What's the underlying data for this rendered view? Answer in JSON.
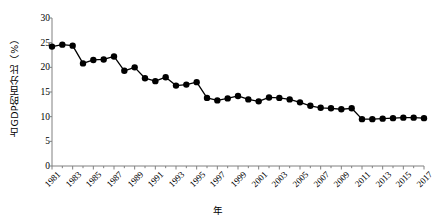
{
  "chart_data": {
    "type": "line",
    "title": "",
    "xlabel": "年",
    "ylabel": "占GDP的百分比（%）",
    "x": [
      1981,
      1982,
      1983,
      1984,
      1985,
      1986,
      1987,
      1988,
      1989,
      1990,
      1991,
      1992,
      1993,
      1994,
      1995,
      1996,
      1997,
      1998,
      1999,
      2000,
      2001,
      2002,
      2003,
      2004,
      2005,
      2006,
      2007,
      2008,
      2009,
      2010,
      2011,
      2012,
      2013,
      2014,
      2015,
      2016,
      2017
    ],
    "values": [
      24.2,
      24.6,
      24.4,
      20.8,
      21.5,
      21.6,
      22.2,
      19.3,
      20.0,
      17.8,
      17.2,
      18.0,
      16.3,
      16.5,
      17.0,
      13.8,
      13.3,
      13.7,
      14.2,
      13.5,
      13.1,
      13.9,
      13.8,
      13.5,
      12.9,
      12.2,
      11.8,
      11.7,
      11.5,
      11.7,
      9.5,
      9.5,
      9.6,
      9.7,
      9.8,
      9.8,
      9.7
    ],
    "xlim": [
      1981,
      2017
    ],
    "ylim": [
      0,
      30
    ],
    "yticks": [
      0,
      5,
      10,
      15,
      20,
      25,
      30
    ],
    "ytick_labels": [
      "0",
      "5",
      "10",
      "15",
      "20",
      "25",
      "30"
    ],
    "xticks": [
      1981,
      1983,
      1985,
      1987,
      1989,
      1991,
      1993,
      1995,
      1997,
      1999,
      2001,
      2003,
      2005,
      2007,
      2009,
      2011,
      2013,
      2015,
      2017
    ],
    "xtick_labels": [
      "1981",
      "1983",
      "1985",
      "1987",
      "1989",
      "1991",
      "1993",
      "1995",
      "1997",
      "1999",
      "2001",
      "2003",
      "2005",
      "2007",
      "2009",
      "2011",
      "2013",
      "2015",
      "2017"
    ],
    "grid": false,
    "legend": null,
    "series_color": "#000000",
    "marker": "circle",
    "marker_size": 3.2,
    "line_width": 1.3,
    "axis_color": "#808080"
  }
}
